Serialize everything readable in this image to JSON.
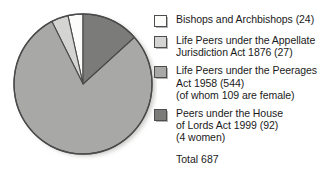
{
  "chart_data": {
    "type": "pie",
    "title": "",
    "total_label": "Total 687",
    "total": 687,
    "legend_position": "right",
    "categories": [
      "Bishops and Archbishops (24)",
      "Life Peers under the Appellate\nJurisdiction Act 1876 (27)",
      "Life Peers under the Peerages\nAct 1958 (544)\n(of whom 109 are female)",
      "Peers under the House\nof Lords Act 1999 (92)\n(4 women)"
    ],
    "values": [
      24,
      27,
      544,
      92
    ],
    "colors": [
      "#fcfcfa",
      "#d4d4d2",
      "#a8a8a6",
      "#7b7b79"
    ],
    "slices": [
      {
        "label": "Bishops and Archbishops (24)",
        "value": 24,
        "percent": 3.5,
        "color": "#fcfcfa",
        "start_angle": 0,
        "sweep_angle": 12.6
      },
      {
        "label": "Life Peers under the Appellate Jurisdiction Act 1876 (27)",
        "value": 27,
        "percent": 3.9,
        "color": "#d4d4d2",
        "start_angle": 12.6,
        "sweep_angle": 14.2
      },
      {
        "label": "Life Peers under the Peerages Act 1958 (544)",
        "value": 544,
        "percent": 79.2,
        "color": "#a8a8a6",
        "start_angle": 26.8,
        "sweep_angle": 285.1
      },
      {
        "label": "Peers under the House of Lords Act 1999 (92)",
        "value": 92,
        "percent": 13.4,
        "color": "#7b7b79",
        "start_angle": 311.9,
        "sweep_angle": 48.1
      }
    ]
  },
  "legend": {
    "items": [
      {
        "swatch_name": "legend-swatch-bishops",
        "label": "Bishops and Archbishops (24)",
        "color": "#fcfcfa"
      },
      {
        "swatch_name": "legend-swatch-life-peers-1876",
        "label": "Life Peers under the Appellate\nJurisdiction Act 1876 (27)",
        "color": "#d4d4d2"
      },
      {
        "swatch_name": "legend-swatch-life-peers-1958",
        "label": "Life Peers under the Peerages\nAct 1958 (544)\n(of whom 109 are female)",
        "color": "#a8a8a6"
      },
      {
        "swatch_name": "legend-swatch-peers-1999",
        "label": "Peers under the House\nof Lords Act 1999 (92)\n(4 women)",
        "color": "#7b7b79"
      }
    ],
    "total": "Total 687"
  }
}
